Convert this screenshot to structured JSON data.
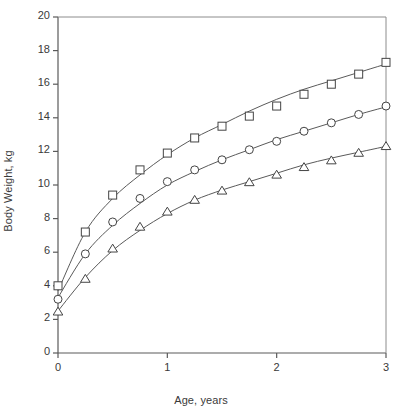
{
  "chart_data": {
    "type": "scatter",
    "title": "",
    "xlabel": "Age, years",
    "ylabel": "Body Weight, kg",
    "xlim": [
      0,
      3
    ],
    "ylim": [
      0,
      20
    ],
    "x_ticks": [
      "0",
      "1",
      "2",
      "3"
    ],
    "x_tick_values": [
      0,
      1,
      2,
      3
    ],
    "y_ticks": [
      "0",
      "2",
      "4",
      "6",
      "8",
      "10",
      "12",
      "14",
      "16",
      "18",
      "20"
    ],
    "y_tick_values": [
      0,
      2,
      4,
      6,
      8,
      10,
      12,
      14,
      16,
      18,
      20
    ],
    "grid": false,
    "legend": "none",
    "x": [
      0,
      0.25,
      0.5,
      0.75,
      1,
      1.25,
      1.5,
      1.75,
      2,
      2.25,
      2.5,
      2.75,
      3
    ],
    "series": [
      {
        "name": "square-series",
        "marker": "square",
        "color": "#3a3a3a",
        "values": [
          4.0,
          7.2,
          9.4,
          10.9,
          11.9,
          12.8,
          13.5,
          14.1,
          14.7,
          15.4,
          16.0,
          16.6,
          17.3
        ],
        "fit_curve": [
          {
            "x": 0,
            "y": 3.7
          },
          {
            "x": 0.25,
            "y": 7.2
          },
          {
            "x": 0.5,
            "y": 9.2
          },
          {
            "x": 0.75,
            "y": 10.6
          },
          {
            "x": 1,
            "y": 11.8
          },
          {
            "x": 1.25,
            "y": 12.8
          },
          {
            "x": 1.5,
            "y": 13.6
          },
          {
            "x": 1.75,
            "y": 14.4
          },
          {
            "x": 2,
            "y": 15.1
          },
          {
            "x": 2.25,
            "y": 15.7
          },
          {
            "x": 2.5,
            "y": 16.2
          },
          {
            "x": 2.75,
            "y": 16.7
          },
          {
            "x": 3,
            "y": 17.2
          }
        ]
      },
      {
        "name": "circle-series",
        "marker": "circle",
        "color": "#3a3a3a",
        "values": [
          3.2,
          5.9,
          7.8,
          9.2,
          10.2,
          10.9,
          11.5,
          12.1,
          12.6,
          13.2,
          13.7,
          14.2,
          14.7
        ],
        "fit_curve": [
          {
            "x": 0,
            "y": 3.3
          },
          {
            "x": 0.25,
            "y": 5.9
          },
          {
            "x": 0.5,
            "y": 7.6
          },
          {
            "x": 0.75,
            "y": 8.9
          },
          {
            "x": 1,
            "y": 10.0
          },
          {
            "x": 1.25,
            "y": 10.8
          },
          {
            "x": 1.5,
            "y": 11.5
          },
          {
            "x": 1.75,
            "y": 12.1
          },
          {
            "x": 2,
            "y": 12.7
          },
          {
            "x": 2.25,
            "y": 13.2
          },
          {
            "x": 2.5,
            "y": 13.7
          },
          {
            "x": 2.75,
            "y": 14.2
          },
          {
            "x": 3,
            "y": 14.65
          }
        ]
      },
      {
        "name": "triangle-series",
        "marker": "triangle",
        "color": "#3a3a3a",
        "values": [
          2.45,
          4.4,
          6.2,
          7.5,
          8.4,
          9.1,
          9.65,
          10.15,
          10.6,
          11.05,
          11.45,
          11.9,
          12.3
        ],
        "fit_curve": [
          {
            "x": 0,
            "y": 2.5
          },
          {
            "x": 0.25,
            "y": 4.5
          },
          {
            "x": 0.5,
            "y": 6.1
          },
          {
            "x": 0.75,
            "y": 7.3
          },
          {
            "x": 1,
            "y": 8.3
          },
          {
            "x": 1.25,
            "y": 9.1
          },
          {
            "x": 1.5,
            "y": 9.7
          },
          {
            "x": 1.75,
            "y": 10.2
          },
          {
            "x": 2,
            "y": 10.7
          },
          {
            "x": 2.25,
            "y": 11.2
          },
          {
            "x": 2.5,
            "y": 11.6
          },
          {
            "x": 2.75,
            "y": 11.95
          },
          {
            "x": 3,
            "y": 12.3
          }
        ]
      }
    ]
  }
}
